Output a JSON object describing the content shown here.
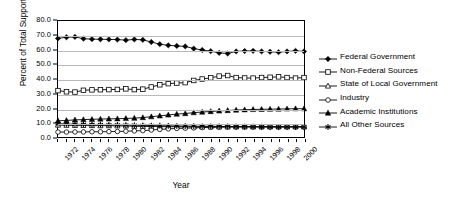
{
  "chart_data": {
    "type": "line",
    "title": "",
    "xlabel": "Year",
    "ylabel": "Percent of Total Support",
    "xlim": [
      1972,
      2001
    ],
    "ylim": [
      0,
      80
    ],
    "ytick_step": 10,
    "grid": "horizontal",
    "legend_position": "right",
    "x": [
      1972,
      1973,
      1974,
      1975,
      1976,
      1977,
      1978,
      1979,
      1980,
      1981,
      1982,
      1983,
      1984,
      1985,
      1986,
      1987,
      1988,
      1989,
      1990,
      1991,
      1992,
      1993,
      1994,
      1995,
      1996,
      1997,
      1998,
      1999,
      2000,
      2001
    ],
    "xtick_labels": [
      "1972",
      "1974",
      "1976",
      "1978",
      "1980",
      "1982",
      "1984",
      "1986",
      "1988",
      "1990",
      "1992",
      "1994",
      "1996",
      "1998",
      "2000"
    ],
    "ytick_labels": [
      "0.0",
      "10.0",
      "20.0",
      "30.0",
      "40.0",
      "50.0",
      "60.0",
      "70.0",
      "80.0"
    ],
    "series": [
      {
        "name": "Federal Government",
        "marker": "filled-diamond",
        "values": [
          68.0,
          68.8,
          69.0,
          67.8,
          67.5,
          67.4,
          67.3,
          67.2,
          66.8,
          67.3,
          67.0,
          65.5,
          64.0,
          63.2,
          62.8,
          62.5,
          61.0,
          60.0,
          59.2,
          58.0,
          57.6,
          59.0,
          59.3,
          59.4,
          59.0,
          58.8,
          58.5,
          59.0,
          59.4,
          59.0
        ]
      },
      {
        "name": "Non-Federal Sources",
        "marker": "open-square",
        "values": [
          32.0,
          31.2,
          31.0,
          32.2,
          32.5,
          32.6,
          32.7,
          32.8,
          33.2,
          32.7,
          33.0,
          34.5,
          36.0,
          36.8,
          37.2,
          37.5,
          39.0,
          40.0,
          40.8,
          42.0,
          42.4,
          41.0,
          40.7,
          40.6,
          41.0,
          41.2,
          41.5,
          41.0,
          40.6,
          41.0
        ]
      },
      {
        "name": "State of Local Government",
        "marker": "open-triangle",
        "values": [
          8.2,
          8.1,
          8.0,
          8.0,
          7.9,
          7.8,
          7.8,
          7.7,
          7.6,
          7.4,
          7.3,
          7.2,
          7.2,
          7.1,
          7.1,
          7.0,
          7.0,
          7.0,
          7.0,
          7.0,
          7.0,
          7.0,
          7.0,
          7.0,
          7.0,
          7.0,
          7.0,
          7.0,
          7.0,
          7.0
        ]
      },
      {
        "name": "Industry",
        "marker": "open-circle",
        "values": [
          3.4,
          3.4,
          3.5,
          3.5,
          3.6,
          3.6,
          3.7,
          3.8,
          4.0,
          4.2,
          4.4,
          4.8,
          5.2,
          5.6,
          5.9,
          6.1,
          6.3,
          6.5,
          6.7,
          6.8,
          6.9,
          7.0,
          7.0,
          7.0,
          7.0,
          7.0,
          7.0,
          7.0,
          7.0,
          7.0
        ]
      },
      {
        "name": "Academic Institutions",
        "marker": "filled-triangle",
        "values": [
          11.2,
          11.4,
          11.8,
          12.0,
          12.2,
          12.4,
          12.5,
          12.6,
          12.8,
          13.0,
          13.4,
          14.0,
          14.6,
          15.2,
          15.8,
          16.2,
          16.8,
          17.2,
          17.6,
          18.0,
          18.3,
          18.6,
          18.8,
          19.0,
          19.1,
          19.2,
          19.3,
          19.4,
          19.5,
          19.5
        ]
      },
      {
        "name": "All Other Sources",
        "marker": "asterisk",
        "values": [
          9.2,
          9.0,
          8.8,
          8.7,
          8.6,
          8.5,
          8.4,
          8.3,
          8.2,
          8.1,
          8.0,
          7.9,
          7.8,
          7.7,
          7.6,
          7.5,
          7.5,
          7.4,
          7.4,
          7.3,
          7.3,
          7.2,
          7.2,
          7.1,
          7.1,
          7.0,
          7.0,
          7.0,
          7.0,
          7.0
        ]
      }
    ]
  }
}
